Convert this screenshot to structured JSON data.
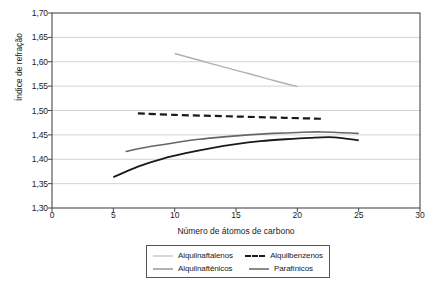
{
  "chart_data": {
    "type": "line",
    "title": "",
    "xlabel": "Número de átomos de carbono",
    "ylabel": "Índice de refração",
    "xlim": [
      0,
      30
    ],
    "ylim": [
      1.3,
      1.7
    ],
    "xticks": [
      "0",
      "5",
      "10",
      "15",
      "20",
      "25",
      "30"
    ],
    "xtick_values": [
      0,
      5,
      10,
      15,
      20,
      25,
      30
    ],
    "yticks": [
      "1,30",
      "1,35",
      "1,40",
      "1,45",
      "1,50",
      "1,55",
      "1,60",
      "1,65",
      "1,70"
    ],
    "ytick_values": [
      1.3,
      1.35,
      1.4,
      1.45,
      1.5,
      1.55,
      1.6,
      1.65,
      1.7
    ],
    "grid": "horizontal",
    "legend_position": "below-center",
    "series": [
      {
        "name": "Alquilnaftalenos",
        "color": "#b0b0b0",
        "dash": "solid",
        "width": 1.4,
        "x": [
          10,
          12,
          14,
          16,
          18,
          20
        ],
        "y": [
          1.617,
          1.603,
          1.589,
          1.576,
          1.562,
          1.549
        ]
      },
      {
        "name": "Alquilbenzenos",
        "color": "#1a1a1a",
        "dash": "dashed",
        "width": 2.2,
        "x": [
          7,
          10,
          13,
          16,
          19,
          22
        ],
        "y": [
          1.494,
          1.491,
          1.489,
          1.487,
          1.485,
          1.483
        ]
      },
      {
        "name": "Alquilnaftênicos",
        "color": "#666666",
        "dash": "solid",
        "width": 1.6,
        "x": [
          6,
          8,
          10,
          12,
          14,
          16,
          18,
          20,
          22,
          25
        ],
        "y": [
          1.416,
          1.426,
          1.434,
          1.441,
          1.446,
          1.45,
          1.453,
          1.455,
          1.456,
          1.453
        ]
      },
      {
        "name": "Parafínicos",
        "color": "#1a1a1a",
        "dash": "solid",
        "width": 1.8,
        "x": [
          5,
          7,
          9,
          11,
          13,
          15,
          17,
          19,
          21,
          23,
          25
        ],
        "y": [
          1.363,
          1.385,
          1.401,
          1.413,
          1.423,
          1.431,
          1.437,
          1.441,
          1.444,
          1.445,
          1.439
        ]
      }
    ]
  },
  "legend": {
    "entries": [
      {
        "label": "Alquilnaftalenos"
      },
      {
        "label": "Alquilbenzenos"
      },
      {
        "label": "Alquilnaftênicos"
      },
      {
        "label": "Parafínicos"
      }
    ]
  },
  "colors": {
    "axis": "#4a4a4a",
    "grid": "#c8c8c8",
    "background": "#ffffff",
    "legend_border": "#555555"
  }
}
